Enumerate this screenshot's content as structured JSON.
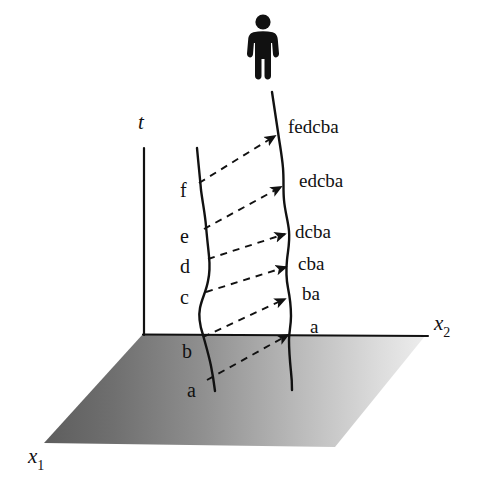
{
  "figure": {
    "background_color": "#ffffff",
    "ink_color": "#111111"
  },
  "observer": {
    "icon": "person-pictogram",
    "position": {
      "x": 263,
      "y": 45
    }
  },
  "axes": {
    "t": {
      "label": "t",
      "italic": true,
      "x": 144,
      "y_top": 148,
      "y_bottom": 335
    },
    "x1": {
      "label": "x",
      "subscript": "1",
      "italic": true
    },
    "x2": {
      "label": "x",
      "subscript": "2",
      "italic": true
    }
  },
  "ground_plane": {
    "gradient_dark": "#606060",
    "gradient_light": "#e2e2e2",
    "corners": [
      [
        143,
        334
      ],
      [
        425,
        336
      ],
      [
        335,
        447
      ],
      [
        44,
        443
      ]
    ]
  },
  "worldlines": {
    "left": {
      "name": "emitter-worldline",
      "color": "#111111",
      "labels": [
        "f",
        "e",
        "d",
        "c",
        "b",
        "a"
      ]
    },
    "right": {
      "name": "observer-worldline",
      "color": "#111111",
      "labels": [
        "fedcba",
        "edcba",
        "dcba",
        "cba",
        "ba",
        "a"
      ]
    }
  },
  "left_events": [
    {
      "label": "f",
      "x": 182,
      "y": 189
    },
    {
      "label": "e",
      "x": 182,
      "y": 235
    },
    {
      "label": "d",
      "x": 182,
      "y": 265
    },
    {
      "label": "c",
      "x": 182,
      "y": 296
    },
    {
      "label": "b",
      "x": 184,
      "y": 350
    },
    {
      "label": "a",
      "x": 189,
      "y": 389
    }
  ],
  "right_events": [
    {
      "label": "fedcba",
      "x": 288,
      "y": 126
    },
    {
      "label": "edcba",
      "x": 299,
      "y": 180
    },
    {
      "label": "dcba",
      "x": 295,
      "y": 231
    },
    {
      "label": "cba",
      "x": 298,
      "y": 263
    },
    {
      "label": "ba",
      "x": 302,
      "y": 293
    },
    {
      "label": "a",
      "x": 310,
      "y": 326
    }
  ],
  "signal_arrows": [
    {
      "name": "signal-f",
      "from": [
        199,
        183
      ],
      "to": [
        277,
        135
      ]
    },
    {
      "name": "signal-e",
      "from": [
        204,
        229
      ],
      "to": [
        283,
        186
      ]
    },
    {
      "name": "signal-d",
      "from": [
        208,
        259
      ],
      "to": [
        287,
        233
      ]
    },
    {
      "name": "signal-c",
      "from": [
        206,
        292
      ],
      "to": [
        288,
        266
      ]
    },
    {
      "name": "signal-b",
      "from": [
        203,
        337
      ],
      "to": [
        287,
        298
      ]
    },
    {
      "name": "signal-a",
      "from": [
        207,
        380
      ],
      "to": [
        290,
        334
      ]
    }
  ],
  "axis_label_positions": {
    "t": {
      "x": 139,
      "y": 120
    },
    "x1": {
      "x": 28,
      "y": 455
    },
    "x2": {
      "x": 434,
      "y": 322
    }
  }
}
